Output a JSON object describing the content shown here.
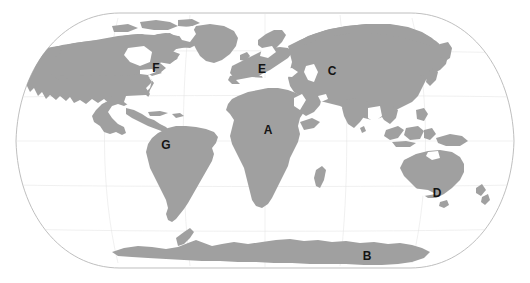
{
  "figure": {
    "type": "world-map",
    "projection": "Robinson",
    "title": "",
    "background_color": "#ffffff",
    "land_color": "#a0a0a0",
    "ocean_color": "#ffffff",
    "graticule_color": "#c9c9c9",
    "outline_color": "#b5b5b5",
    "label_color": "#141414",
    "width": 530,
    "height": 283
  },
  "labels": [
    {
      "id": "label-a",
      "text": "A",
      "region": "Africa",
      "x": 268,
      "y": 130
    },
    {
      "id": "label-b",
      "text": "B",
      "region": "Antarctica",
      "x": 367,
      "y": 256
    },
    {
      "id": "label-c",
      "text": "C",
      "region": "Asia",
      "x": 332,
      "y": 71
    },
    {
      "id": "label-d",
      "text": "D",
      "region": "Australia",
      "x": 437,
      "y": 193
    },
    {
      "id": "label-e",
      "text": "E",
      "region": "Europe",
      "x": 262,
      "y": 69
    },
    {
      "id": "label-f",
      "text": "F",
      "region": "North America",
      "x": 156,
      "y": 68
    },
    {
      "id": "label-g",
      "text": "G",
      "region": "South America",
      "x": 166,
      "y": 145
    }
  ]
}
